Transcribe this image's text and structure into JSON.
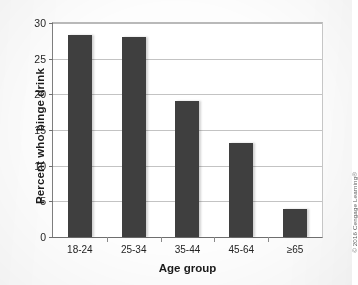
{
  "chart_data": {
    "type": "bar",
    "title": "",
    "categories": [
      "18-24",
      "25-34",
      "35-44",
      "45-64",
      "≥65"
    ],
    "values": [
      28.3,
      28.0,
      19.1,
      13.2,
      3.9
    ],
    "xlabel": "Age group",
    "ylabel": "Percent who binge drink",
    "ylim": [
      0,
      30
    ],
    "yticks": [
      0,
      5,
      10,
      15,
      20,
      25,
      30
    ],
    "ytick_labels": [
      "0",
      "5",
      "10",
      "15",
      "20",
      "25",
      "30"
    ],
    "grid": "horizontal",
    "legend": "none",
    "bar_color": "#3f3f3f"
  },
  "figure": {
    "credit": "© 2016 Cengage Learning®",
    "background_color": "#fdfdfd",
    "grid_color": "#c3c3c3",
    "axis_color": "#6e6e6e"
  }
}
